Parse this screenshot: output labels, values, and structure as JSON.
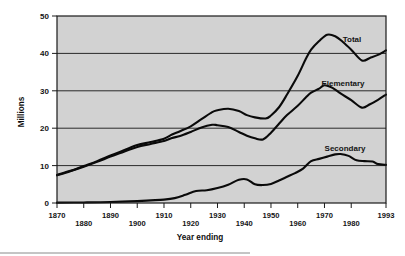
{
  "chart_data": {
    "type": "line",
    "title": "",
    "xlabel": "Year ending",
    "ylabel": "Millions",
    "xlim": [
      1870,
      1993
    ],
    "ylim": [
      0,
      50
    ],
    "grid": true,
    "legend_position": "inline-right",
    "xticks": [
      1870,
      1880,
      1890,
      1900,
      1910,
      1920,
      1930,
      1940,
      1950,
      1960,
      1970,
      1980,
      1993
    ],
    "xtick_labels": [
      "1870",
      "1880",
      "1890",
      "1900",
      "1910",
      "1920",
      "1930",
      "1940",
      "1950",
      "1960",
      "1970",
      "1980",
      "1993"
    ],
    "yticks": [
      0,
      10,
      20,
      30,
      40,
      50
    ],
    "ytick_labels": [
      "0",
      "10",
      "20",
      "30",
      "40",
      "50"
    ],
    "series": [
      {
        "name": "Total",
        "label": "Total",
        "x": [
          1870,
          1875,
          1880,
          1885,
          1890,
          1895,
          1900,
          1905,
          1910,
          1913,
          1916,
          1920,
          1924,
          1928,
          1930,
          1934,
          1938,
          1941,
          1944,
          1948,
          1950,
          1953,
          1956,
          1960,
          1963,
          1965,
          1968,
          1971,
          1974,
          1977,
          1980,
          1984,
          1987,
          1990,
          1993
        ],
        "y": [
          7.5,
          8.6,
          9.9,
          11.2,
          12.7,
          14.1,
          15.5,
          16.3,
          17.2,
          18.3,
          19.2,
          20.5,
          22.4,
          24.3,
          24.8,
          25.2,
          24.6,
          23.5,
          22.9,
          22.6,
          23.4,
          25.6,
          29.0,
          34.0,
          38.5,
          41.0,
          43.3,
          45.0,
          44.6,
          43.0,
          41.0,
          38.1,
          38.8,
          39.6,
          40.8
        ],
        "units": "millions"
      },
      {
        "name": "Elementary",
        "label": "Elementary",
        "x": [
          1870,
          1875,
          1880,
          1885,
          1890,
          1895,
          1900,
          1905,
          1910,
          1913,
          1916,
          1920,
          1924,
          1928,
          1930,
          1934,
          1938,
          1941,
          1944,
          1947,
          1950,
          1953,
          1956,
          1960,
          1963,
          1965,
          1968,
          1970,
          1973,
          1976,
          1980,
          1984,
          1987,
          1990,
          1993
        ],
        "y": [
          7.4,
          8.5,
          9.7,
          11.0,
          12.4,
          13.7,
          15.0,
          15.8,
          16.6,
          17.4,
          17.9,
          19.0,
          20.2,
          20.9,
          20.8,
          20.3,
          19.0,
          18.0,
          17.3,
          17.0,
          18.8,
          21.2,
          23.5,
          26.0,
          28.2,
          29.5,
          30.6,
          31.5,
          30.8,
          29.3,
          27.5,
          25.5,
          26.4,
          27.6,
          29.0
        ],
        "units": "millions"
      },
      {
        "name": "Secondary",
        "label": "Secondary",
        "x": [
          1870,
          1880,
          1890,
          1900,
          1905,
          1910,
          1914,
          1918,
          1922,
          1926,
          1930,
          1934,
          1938,
          1941,
          1944,
          1947,
          1950,
          1953,
          1956,
          1959,
          1962,
          1965,
          1968,
          1971,
          1974,
          1976,
          1979,
          1982,
          1985,
          1988,
          1990,
          1993
        ],
        "y": [
          0.1,
          0.15,
          0.25,
          0.5,
          0.7,
          0.9,
          1.3,
          2.2,
          3.2,
          3.4,
          4.0,
          4.9,
          6.2,
          6.3,
          5.0,
          4.8,
          5.1,
          6.0,
          7.0,
          8.0,
          9.2,
          11.2,
          11.8,
          12.4,
          13.0,
          13.1,
          12.6,
          11.4,
          11.2,
          11.1,
          10.4,
          10.2
        ],
        "units": "millions"
      }
    ]
  },
  "colors": {
    "plot_background": "#d2d2d2",
    "line": "#0a0a0a",
    "grid": "#2a2a2a",
    "text": "#141414",
    "page_background": "#ffffff"
  }
}
